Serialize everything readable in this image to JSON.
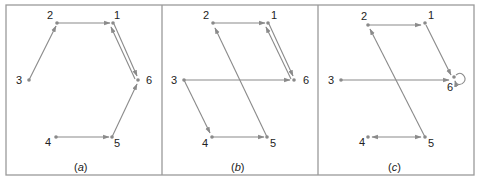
{
  "figure": {
    "panels": [
      {
        "caption": "(a)",
        "caption_letter": "a",
        "nodes": [
          {
            "id": "1",
            "x": 113,
            "y": 23
          },
          {
            "id": "2",
            "x": 57,
            "y": 23
          },
          {
            "id": "3",
            "x": 29,
            "y": 80
          },
          {
            "id": "4",
            "x": 56,
            "y": 137
          },
          {
            "id": "5",
            "x": 112,
            "y": 137
          },
          {
            "id": "6",
            "x": 138,
            "y": 80
          }
        ],
        "edges": [
          {
            "from": "3",
            "to": "2"
          },
          {
            "from": "2",
            "to": "1"
          },
          {
            "from": "1",
            "to": "6"
          },
          {
            "from": "6",
            "to": "1"
          },
          {
            "from": "5",
            "to": "6"
          },
          {
            "from": "4",
            "to": "5"
          }
        ]
      },
      {
        "caption": "(b)",
        "caption_letter": "b",
        "nodes": [
          {
            "id": "1",
            "x": 268,
            "y": 23
          },
          {
            "id": "2",
            "x": 213,
            "y": 23
          },
          {
            "id": "3",
            "x": 184,
            "y": 80
          },
          {
            "id": "4",
            "x": 212,
            "y": 137
          },
          {
            "id": "5",
            "x": 267,
            "y": 137
          },
          {
            "id": "6",
            "x": 294,
            "y": 80
          }
        ],
        "edges": [
          {
            "from": "2",
            "to": "1"
          },
          {
            "from": "1",
            "to": "6"
          },
          {
            "from": "6",
            "to": "1"
          },
          {
            "from": "3",
            "to": "6"
          },
          {
            "from": "3",
            "to": "4"
          },
          {
            "from": "4",
            "to": "5"
          },
          {
            "from": "5",
            "to": "2"
          }
        ]
      },
      {
        "caption": "(c)",
        "caption_letter": "c",
        "nodes": [
          {
            "id": "1",
            "x": 425,
            "y": 23
          },
          {
            "id": "2",
            "x": 368,
            "y": 25
          },
          {
            "id": "3",
            "x": 341,
            "y": 80
          },
          {
            "id": "4",
            "x": 368,
            "y": 137
          },
          {
            "id": "5",
            "x": 425,
            "y": 137
          },
          {
            "id": "6",
            "x": 454,
            "y": 77
          }
        ],
        "edges": [
          {
            "from": "2",
            "to": "1"
          },
          {
            "from": "1",
            "to": "6"
          },
          {
            "from": "3",
            "to": "6"
          },
          {
            "from": "4",
            "to": "5"
          },
          {
            "from": "5",
            "to": "4"
          },
          {
            "from": "5",
            "to": "2"
          },
          {
            "from": "6",
            "to": "6",
            "self_loop": true
          }
        ]
      }
    ]
  },
  "labels": {
    "a": {
      "n1": "1",
      "n2": "2",
      "n3": "3",
      "n4": "4",
      "n5": "5",
      "n6": "6",
      "caption_open": "(",
      "caption_letter": "a",
      "caption_close": ")"
    },
    "b": {
      "n1": "1",
      "n2": "2",
      "n3": "3",
      "n4": "4",
      "n5": "5",
      "n6": "6",
      "caption_open": "(",
      "caption_letter": "b",
      "caption_close": ")"
    },
    "c": {
      "n1": "1",
      "n2": "2",
      "n3": "3",
      "n4": "4",
      "n5": "5",
      "n6": "6",
      "caption_open": "(",
      "caption_letter": "c",
      "caption_close": ")"
    }
  },
  "colors": {
    "edge": "#8a8a8a",
    "frame": "#9a9a9a",
    "text": "#222222"
  }
}
